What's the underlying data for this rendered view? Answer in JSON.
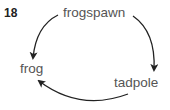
{
  "question_number": "18",
  "diagram": {
    "type": "life-cycle",
    "stages": [
      {
        "label": "frogspawn"
      },
      {
        "label": "tadpole"
      },
      {
        "label": "frog"
      }
    ],
    "arrows": [
      {
        "from": "frogspawn",
        "to": "tadpole"
      },
      {
        "from": "tadpole",
        "to": "frog"
      },
      {
        "from": "frogspawn",
        "to": "frog"
      }
    ],
    "colors": {
      "arrow": "#222222",
      "label": "#555555",
      "number": "#222222"
    }
  }
}
